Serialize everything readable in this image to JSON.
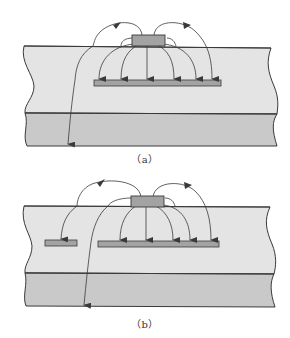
{
  "colors": {
    "dielectric": "#e4e4e4",
    "lower_layer": "#c9c9c9",
    "trace": "#a3a3a3",
    "outline": "#3a3a3a",
    "background": "#ffffff"
  },
  "figures": [
    {
      "id": "a",
      "caption": "（a）",
      "elements": [
        "top-trace",
        "reference-plane",
        "field-lines",
        "fringe-field-line"
      ]
    },
    {
      "id": "b",
      "caption": "（b）",
      "elements": [
        "top-trace",
        "small-adjacent-plane",
        "reference-plane",
        "field-lines",
        "fringe-field-line"
      ]
    }
  ]
}
